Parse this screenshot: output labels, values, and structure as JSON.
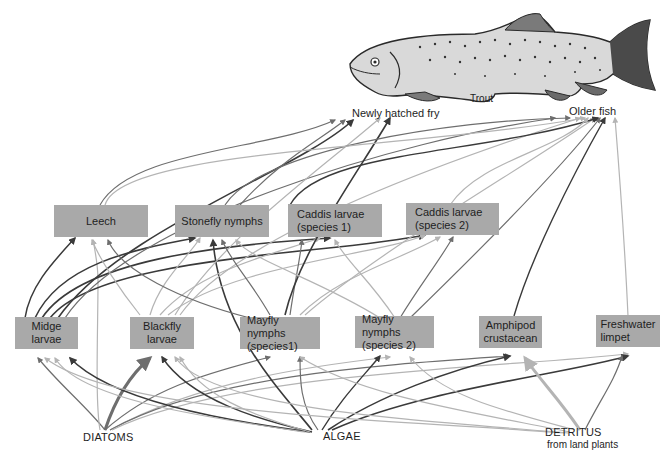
{
  "top_consumer": {
    "label": "Trout",
    "stages": [
      {
        "id": "fry",
        "label": "Newly hatched fry"
      },
      {
        "id": "older",
        "label": "Older fish"
      }
    ]
  },
  "invertebrates_upper": [
    {
      "id": "leech",
      "lines": [
        "Leech"
      ]
    },
    {
      "id": "stonefly",
      "lines": [
        "Stonefly nymphs"
      ]
    },
    {
      "id": "caddis1",
      "lines": [
        "Caddis larvae",
        "(species 1)"
      ]
    },
    {
      "id": "caddis2",
      "lines": [
        "Caddis larvae",
        "(species 2)"
      ]
    }
  ],
  "invertebrates_lower": [
    {
      "id": "midge",
      "lines": [
        "Midge",
        "larvae"
      ]
    },
    {
      "id": "blackfly",
      "lines": [
        "Blackfly",
        "larvae"
      ]
    },
    {
      "id": "mayfly1",
      "lines": [
        "Mayfly nymphs",
        "(species1)"
      ]
    },
    {
      "id": "mayfly2",
      "lines": [
        "Mayfly nymphs",
        "(species 2)"
      ]
    },
    {
      "id": "amphipod",
      "lines": [
        "Amphipod",
        "crustacean"
      ]
    },
    {
      "id": "limpet",
      "lines": [
        "Freshwater",
        "limpet"
      ]
    }
  ],
  "producers": [
    {
      "id": "diatoms",
      "lines": [
        "DIATOMS"
      ]
    },
    {
      "id": "algae",
      "lines": [
        "ALGAE"
      ]
    },
    {
      "id": "detritus",
      "lines": [
        "DETRITUS",
        "from land plants"
      ]
    }
  ],
  "colors": {
    "box_fill": "#a9a9a9",
    "arrow_dark": "#3a3a3a",
    "arrow_mid": "#6e6e6e",
    "arrow_light": "#b4b4b4",
    "text": "#1e1e1e"
  },
  "edges": [
    {
      "from": "diatoms",
      "to": "midge",
      "tone": "mid",
      "w": 1.2,
      "d": "M105,430 C85,405 60,385 38,358"
    },
    {
      "from": "diatoms",
      "to": "blackfly",
      "tone": "mid",
      "w": 3,
      "d": "M105,430 C115,400 130,375 150,358"
    },
    {
      "from": "diatoms",
      "to": "mayfly1",
      "tone": "mid",
      "w": 1.2,
      "d": "M105,430 C150,390 200,375 270,357"
    },
    {
      "from": "diatoms",
      "to": "mayfly2",
      "tone": "light",
      "w": 1.2,
      "d": "M110,430 C200,380 320,365 390,357"
    },
    {
      "from": "diatoms",
      "to": "amphipod",
      "tone": "mid",
      "w": 1.2,
      "d": "M110,430 C210,375 380,365 510,356"
    },
    {
      "from": "diatoms",
      "to": "limpet",
      "tone": "light",
      "w": 1.2,
      "d": "M112,430 C230,372 500,368 628,354"
    },
    {
      "from": "diatoms",
      "to": "leech",
      "tone": "light",
      "w": 1.2,
      "d": "M100,430 C95,400 98,330 98,280 C98,270 96,255 93,240"
    },
    {
      "from": "algae",
      "to": "midge",
      "tone": "dark",
      "w": 1.6,
      "d": "M310,432 C220,420 110,400 70,358"
    },
    {
      "from": "algae",
      "to": "midge",
      "tone": "light",
      "w": 1.2,
      "d": "M305,432 C210,418 80,400 55,358"
    },
    {
      "from": "algae",
      "to": "blackfly",
      "tone": "dark",
      "w": 1.4,
      "d": "M312,432 C260,420 190,400 162,357"
    },
    {
      "from": "algae",
      "to": "blackfly",
      "tone": "light",
      "w": 1.2,
      "d": "M310,432 C250,415 200,395 180,357"
    },
    {
      "from": "algae",
      "to": "mayfly1",
      "tone": "mid",
      "w": 1.2,
      "d": "M318,430 C300,405 300,380 300,357"
    },
    {
      "from": "algae",
      "to": "mayfly2",
      "tone": "dark",
      "w": 1.4,
      "d": "M322,430 C340,400 360,380 380,356"
    },
    {
      "from": "algae",
      "to": "amphipod",
      "tone": "dark",
      "w": 1.6,
      "d": "M328,430 C380,395 450,370 510,356"
    },
    {
      "from": "algae",
      "to": "limpet",
      "tone": "dark",
      "w": 1.6,
      "d": "M332,430 C420,390 560,375 628,356"
    },
    {
      "from": "algae",
      "to": "stonefly",
      "tone": "dark",
      "w": 1.6,
      "d": "M312,430 C280,390 220,330 213,240"
    },
    {
      "from": "detritus",
      "to": "amphipod",
      "tone": "light",
      "w": 3,
      "d": "M580,430 C560,400 540,380 525,358"
    },
    {
      "from": "detritus",
      "to": "mayfly2",
      "tone": "light",
      "w": 1.2,
      "d": "M575,430 C500,410 440,395 410,357"
    },
    {
      "from": "detritus",
      "to": "mayfly1",
      "tone": "light",
      "w": 1.2,
      "d": "M570,432 C460,410 360,395 300,357"
    },
    {
      "from": "detritus",
      "to": "midge",
      "tone": "light",
      "w": 1.2,
      "d": "M565,433 C400,420 120,415 45,358"
    },
    {
      "from": "detritus",
      "to": "blackfly",
      "tone": "light",
      "w": 1.2,
      "d": "M568,433 C420,420 210,410 175,357"
    },
    {
      "from": "detritus",
      "to": "limpet",
      "tone": "mid",
      "w": 1.2,
      "d": "M585,430 C600,400 615,380 622,356"
    },
    {
      "from": "midge",
      "to": "leech",
      "tone": "dark",
      "w": 1.5,
      "d": "M25,318 C30,285 55,260 75,238"
    },
    {
      "from": "midge",
      "to": "stonefly",
      "tone": "dark",
      "w": 1.6,
      "d": "M35,318 C60,265 130,250 195,238"
    },
    {
      "from": "midge",
      "to": "caddis1",
      "tone": "dark",
      "w": 1.6,
      "d": "M42,318 C80,260 220,245 330,238"
    },
    {
      "from": "midge",
      "to": "caddis2",
      "tone": "dark",
      "w": 1.6,
      "d": "M50,318 C100,255 330,255 425,235"
    },
    {
      "from": "midge",
      "to": "fry",
      "tone": "dark",
      "w": 1.6,
      "d": "M58,318 C120,230 300,170 353,120"
    },
    {
      "from": "midge",
      "to": "older",
      "tone": "mid",
      "w": 1.2,
      "d": "M65,318 C130,220 400,140 555,118"
    },
    {
      "from": "blackfly",
      "to": "stonefly",
      "tone": "light",
      "w": 1.2,
      "d": "M150,315 C160,280 190,255 200,238"
    },
    {
      "from": "blackfly",
      "to": "caddis1",
      "tone": "light",
      "w": 1.2,
      "d": "M160,315 C200,270 270,255 320,238"
    },
    {
      "from": "blackfly",
      "to": "caddis2",
      "tone": "light",
      "w": 1.2,
      "d": "M168,315 C230,265 380,255 425,235"
    },
    {
      "from": "blackfly",
      "to": "fry",
      "tone": "light",
      "w": 1.2,
      "d": "M175,315 C220,240 320,170 380,118"
    },
    {
      "from": "blackfly",
      "to": "older",
      "tone": "light",
      "w": 1.2,
      "d": "M180,315 C240,230 480,150 580,118"
    },
    {
      "from": "blackfly",
      "to": "leech",
      "tone": "light",
      "w": 1.2,
      "d": "M140,315 C120,290 100,260 92,240"
    },
    {
      "from": "mayfly1",
      "to": "leech",
      "tone": "mid",
      "w": 1.2,
      "d": "M250,318 C180,300 120,270 108,240"
    },
    {
      "from": "mayfly1",
      "to": "stonefly",
      "tone": "mid",
      "w": 1.2,
      "d": "M270,315 C250,280 230,260 222,240"
    },
    {
      "from": "mayfly1",
      "to": "caddis1",
      "tone": "mid",
      "w": 1.2,
      "d": "M290,315 C295,280 300,260 302,240"
    },
    {
      "from": "mayfly1",
      "to": "caddis2",
      "tone": "light",
      "w": 1.2,
      "d": "M300,315 C340,275 400,260 440,237"
    },
    {
      "from": "mayfly1",
      "to": "fry",
      "tone": "dark",
      "w": 1.6,
      "d": "M285,315 C300,250 360,170 390,118"
    },
    {
      "from": "mayfly1",
      "to": "older",
      "tone": "light",
      "w": 1.2,
      "d": "M305,315 C380,250 520,170 595,118"
    },
    {
      "from": "mayfly2",
      "to": "stonefly",
      "tone": "light",
      "w": 1.2,
      "d": "M380,318 C320,280 250,260 236,240"
    },
    {
      "from": "mayfly2",
      "to": "caddis1",
      "tone": "light",
      "w": 1.2,
      "d": "M395,318 C370,280 345,260 335,240"
    },
    {
      "from": "mayfly2",
      "to": "caddis2",
      "tone": "mid",
      "w": 1.2,
      "d": "M400,318 C420,285 440,260 453,237"
    },
    {
      "from": "mayfly2",
      "to": "older",
      "tone": "mid",
      "w": 1.2,
      "d": "M410,318 C480,250 560,170 600,118"
    },
    {
      "from": "amphipod",
      "to": "older",
      "tone": "dark",
      "w": 1.4,
      "d": "M514,316 C530,260 570,180 605,118"
    },
    {
      "from": "limpet",
      "to": "older",
      "tone": "light",
      "w": 1.2,
      "d": "M628,316 C625,250 620,180 615,118"
    },
    {
      "from": "stonefly",
      "to": "fry",
      "tone": "mid",
      "w": 1.2,
      "d": "M240,205 C280,160 320,140 345,120"
    },
    {
      "from": "stonefly",
      "to": "older",
      "tone": "mid",
      "w": 1.2,
      "d": "M225,205 C260,150 450,120 570,118"
    },
    {
      "from": "caddis1",
      "to": "older",
      "tone": "dark",
      "w": 1.4,
      "d": "M290,205 C320,150 480,155 598,118"
    },
    {
      "from": "caddis2",
      "to": "older",
      "tone": "light",
      "w": 1.2,
      "d": "M450,205 C480,160 560,150 588,118"
    },
    {
      "from": "leech",
      "to": "older",
      "tone": "light",
      "w": 1.2,
      "d": "M105,205 C120,150 400,150 585,118"
    },
    {
      "from": "leech",
      "to": "fry",
      "tone": "mid",
      "w": 1.2,
      "d": "M100,205 C130,150 270,150 335,120"
    }
  ]
}
